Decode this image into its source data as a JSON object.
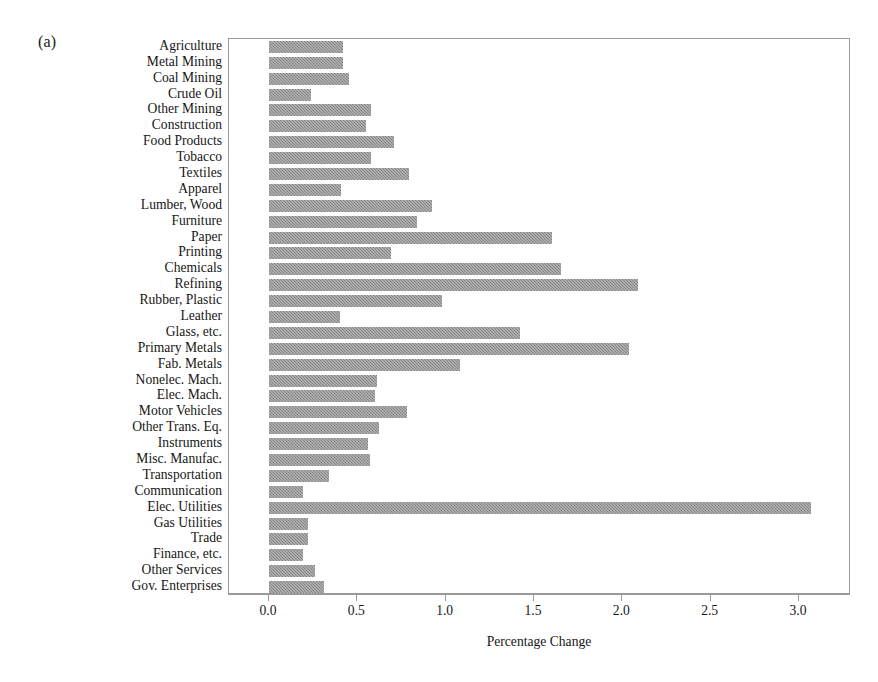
{
  "figure": {
    "panel_label": "(a)",
    "xlabel": "Percentage Change",
    "xticks": [
      "0.0",
      "0.5",
      "1.0",
      "1.5",
      "2.0",
      "2.5",
      "3.0"
    ],
    "bar_color": "#8e8e8e",
    "frame_color": "#9a9a9a"
  },
  "chart_data": {
    "type": "bar",
    "orientation": "horizontal",
    "title": "",
    "subtitle": "",
    "xlabel": "Percentage Change",
    "ylabel": "",
    "xlim": [
      0.0,
      3.2
    ],
    "xticks": [
      0.0,
      0.5,
      1.0,
      1.5,
      2.0,
      2.5,
      3.0
    ],
    "grid": false,
    "legend": null,
    "annotations": [
      "(a)"
    ],
    "categories": [
      "Agriculture",
      "Metal Mining",
      "Coal Mining",
      "Crude Oil",
      "Other Mining",
      "Construction",
      "Food Products",
      "Tobacco",
      "Textiles",
      "Apparel",
      "Lumber, Wood",
      "Furniture",
      "Paper",
      "Printing",
      "Chemicals",
      "Refining",
      "Rubber, Plastic",
      "Leather",
      "Glass, etc.",
      "Primary Metals",
      "Fab. Metals",
      "Nonelec. Mach.",
      "Elec. Mach.",
      "Motor Vehicles",
      "Other Trans. Eq.",
      "Instruments",
      "Misc. Manufac.",
      "Transportation",
      "Communication",
      "Elec. Utilities",
      "Gas Utilities",
      "Trade",
      "Finance, etc.",
      "Other Services",
      "Gov. Enterprises"
    ],
    "values": [
      0.42,
      0.42,
      0.45,
      0.24,
      0.58,
      0.55,
      0.71,
      0.58,
      0.79,
      0.41,
      0.92,
      0.84,
      1.6,
      0.69,
      1.65,
      2.09,
      0.98,
      0.4,
      1.42,
      2.04,
      1.08,
      0.61,
      0.6,
      0.78,
      0.62,
      0.56,
      0.57,
      0.34,
      0.19,
      3.07,
      0.22,
      0.22,
      0.19,
      0.26,
      0.31
    ]
  }
}
